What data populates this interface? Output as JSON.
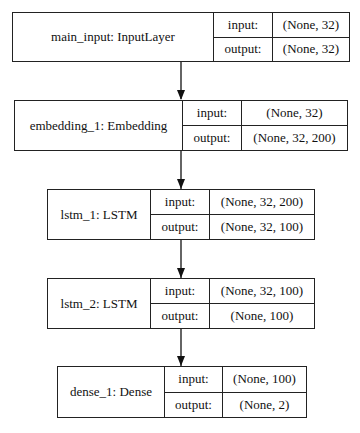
{
  "diagram": {
    "nodes": [
      {
        "name": "main_input: InputLayer",
        "input_label": "input:",
        "output_label": "output:",
        "input": "(None, 32)",
        "output": "(None, 32)"
      },
      {
        "name": "embedding_1: Embedding",
        "input_label": "input:",
        "output_label": "output:",
        "input": "(None, 32)",
        "output": "(None, 32, 200)"
      },
      {
        "name": "lstm_1: LSTM",
        "input_label": "input:",
        "output_label": "output:",
        "input": "(None, 32, 200)",
        "output": "(None, 32, 100)"
      },
      {
        "name": "lstm_2: LSTM",
        "input_label": "input:",
        "output_label": "output:",
        "input": "(None, 32, 100)",
        "output": "(None, 100)"
      },
      {
        "name": "dense_1: Dense",
        "input_label": "input:",
        "output_label": "output:",
        "input": "(None, 100)",
        "output": "(None, 2)"
      }
    ],
    "edges": [
      {
        "from": "main_input",
        "to": "embedding_1"
      },
      {
        "from": "embedding_1",
        "to": "lstm_1"
      },
      {
        "from": "lstm_1",
        "to": "lstm_2"
      },
      {
        "from": "lstm_2",
        "to": "dense_1"
      }
    ],
    "colors": {
      "line": "#222222",
      "background": "#ffffff"
    }
  }
}
